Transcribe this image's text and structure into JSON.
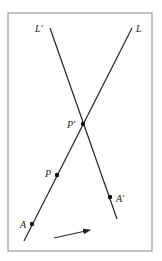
{
  "diagram": {
    "type": "geometry-figure",
    "frame": {
      "x": 8,
      "y": 13,
      "width": 144,
      "height": 238,
      "stroke": "#888888"
    },
    "lines": [
      {
        "name": "L",
        "label": "L",
        "x1": 24,
        "y1": 241,
        "x2": 132,
        "y2": 28,
        "label_x": 136,
        "label_y": 32
      },
      {
        "name": "L-prime",
        "label": "L′",
        "x1": 50,
        "y1": 28,
        "x2": 117,
        "y2": 219,
        "label_x": 35,
        "label_y": 32
      }
    ],
    "points": [
      {
        "name": "P-prime",
        "label": "P′",
        "x": 83,
        "y": 124,
        "label_x": 67,
        "label_y": 128
      },
      {
        "name": "P",
        "label": "P",
        "x": 57,
        "y": 175,
        "label_x": 45,
        "label_y": 177
      },
      {
        "name": "A",
        "label": "A",
        "x": 32,
        "y": 224,
        "label_x": 20,
        "label_y": 228
      },
      {
        "name": "A-prime",
        "label": "A′",
        "x": 110,
        "y": 197,
        "label_x": 116,
        "label_y": 202
      }
    ],
    "arrow": {
      "x1": 54,
      "y1": 238,
      "x2": 90,
      "y2": 230
    },
    "colors": {
      "line": "#222222",
      "point": "#111111",
      "frame": "#888888",
      "background": "#ffffff"
    }
  }
}
